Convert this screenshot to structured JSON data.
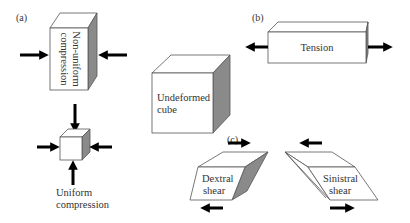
{
  "panels": {
    "a": {
      "label": "(a)",
      "non_uniform": {
        "line1": "Non-uniform",
        "line2": "compression"
      },
      "uniform": {
        "line1": "Uniform",
        "line2": "compression"
      }
    },
    "b": {
      "label": "(b)",
      "tension": "Tension"
    },
    "center": {
      "line1": "Undeformed",
      "line2": "cube"
    },
    "c": {
      "label": "(c)",
      "dextral": {
        "line1": "Dextral",
        "line2": "shear"
      },
      "sinistral": {
        "line1": "Sinistral",
        "line2": "shear"
      }
    }
  },
  "colors": {
    "face": "#ffffff",
    "shaded_side": "#8a8a8a",
    "arrow": "#000000"
  }
}
